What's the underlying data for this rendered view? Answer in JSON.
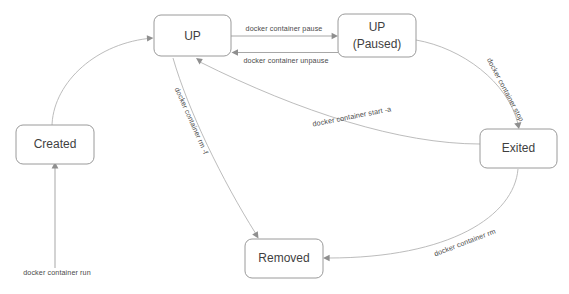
{
  "diagram": {
    "type": "state-diagram",
    "background_color": "#ffffff",
    "node_border_color": "#9a9a9a",
    "node_text_color": "#3f3f3f",
    "edge_color": "#b4b4b4",
    "edge_label_color": "#4a4a4a",
    "nodes": [
      {
        "id": "up",
        "label": "UP",
        "label_line1": "UP",
        "label_line2": "",
        "x": 154,
        "y": 15,
        "width": 77,
        "height": 41
      },
      {
        "id": "up-paused",
        "label": "UP (Paused)",
        "label_line1": "UP",
        "label_line2": "(Paused)",
        "x": 338,
        "y": 14,
        "width": 78,
        "height": 43
      },
      {
        "id": "created",
        "label": "Created",
        "label_line1": "Created",
        "label_line2": "",
        "x": 16,
        "y": 125,
        "width": 78,
        "height": 39
      },
      {
        "id": "exited",
        "label": "Exited",
        "label_line1": "Exited",
        "label_line2": "",
        "x": 480,
        "y": 129,
        "width": 77,
        "height": 39
      },
      {
        "id": "removed",
        "label": "Removed",
        "label_line1": "Removed",
        "label_line2": "",
        "x": 245,
        "y": 239,
        "width": 78,
        "height": 39
      }
    ],
    "edges": [
      {
        "id": "run",
        "label": "docker container run",
        "from": "start",
        "to": "created",
        "label_x": 57,
        "label_y": 273,
        "label_rotate": 0
      },
      {
        "id": "created-to-up",
        "label": "",
        "from": "created",
        "to": "up",
        "label_x": 0,
        "label_y": 0,
        "label_rotate": 0
      },
      {
        "id": "pause",
        "label": "docker container pause",
        "from": "up",
        "to": "up-paused",
        "label_x": 284,
        "label_y": 29,
        "label_rotate": 0
      },
      {
        "id": "unpause",
        "label": "docker container unpause",
        "from": "up-paused",
        "to": "up",
        "label_x": 286,
        "label_y": 61,
        "label_rotate": 0
      },
      {
        "id": "stop",
        "label": "docker container stop",
        "from": "up-paused",
        "to": "exited",
        "label_x": 505,
        "label_y": 90,
        "label_rotate": 62
      },
      {
        "id": "start-a",
        "label": "docker container start -a",
        "from": "exited",
        "to": "up",
        "label_x": 352,
        "label_y": 117,
        "label_rotate": -11
      },
      {
        "id": "rm-f",
        "label": "docker container rm -f",
        "from": "up",
        "to": "removed",
        "label_x": 191,
        "label_y": 121,
        "label_rotate": 66
      },
      {
        "id": "rm",
        "label": "docker container rm",
        "from": "exited",
        "to": "removed",
        "label_x": 465,
        "label_y": 243,
        "label_rotate": -21
      }
    ]
  }
}
